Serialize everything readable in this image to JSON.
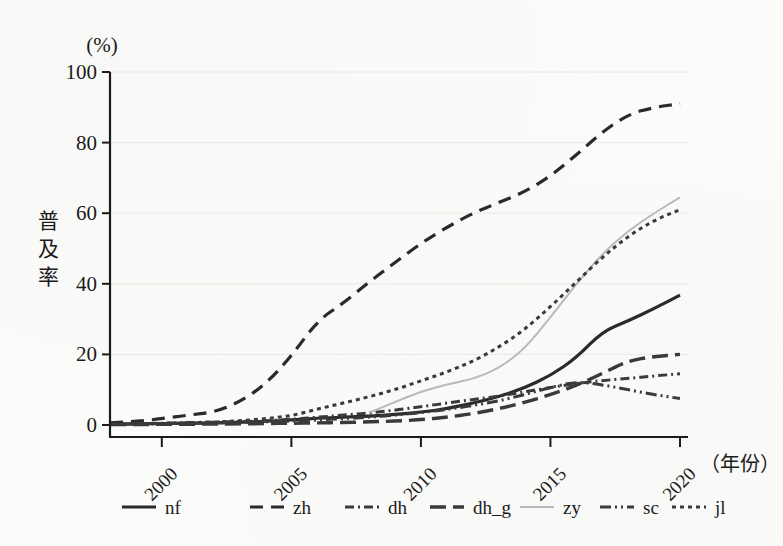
{
  "figure": {
    "background_color": "#fbfbf9",
    "ink_color": "#2a2a2a",
    "grid_color": "#e8e8e6"
  },
  "chart_data": {
    "type": "line",
    "title": "",
    "subtitle": "",
    "xlabel": "（年份）",
    "ylabel": "普及率",
    "yunit": "(%)",
    "xlim": [
      1998,
      2020
    ],
    "ylim": [
      0,
      100
    ],
    "grid": true,
    "legend_position": "bottom",
    "xticks": [
      2000,
      2005,
      2010,
      2015,
      2020
    ],
    "xtick_labels": [
      "2000",
      "2005",
      "2010",
      "2015",
      "2020"
    ],
    "yticks": [
      0,
      20,
      40,
      60,
      80,
      100
    ],
    "ytick_labels": [
      "0",
      "20",
      "40",
      "60",
      "80",
      "100"
    ],
    "x": [
      1998,
      1999,
      2000,
      2001,
      2002,
      2003,
      2004,
      2005,
      2006,
      2007,
      2008,
      2009,
      2010,
      2011,
      2012,
      2013,
      2014,
      2015,
      2016,
      2017,
      2018,
      2019,
      2020
    ],
    "series": [
      {
        "name": "nf",
        "label": "nf",
        "style": "solid",
        "color": "#2a2a2a",
        "width": 3.2,
        "dash": "",
        "values": [
          0.2,
          0.3,
          0.4,
          0.5,
          0.6,
          0.8,
          1.0,
          1.4,
          1.9,
          2.2,
          2.5,
          3.0,
          3.6,
          4.6,
          6.2,
          8.0,
          10.5,
          14.0,
          19.0,
          26.5,
          29.5,
          33.0,
          36.8
        ]
      },
      {
        "name": "zh",
        "label": "zh",
        "style": "dashed",
        "color": "#2a2a2a",
        "width": 3.2,
        "dash": "13,8",
        "values": [
          0.6,
          1.0,
          1.8,
          2.8,
          3.6,
          6.5,
          11.5,
          19.5,
          29.5,
          34.5,
          40.5,
          46.0,
          51.5,
          56.0,
          60.0,
          63.0,
          66.0,
          70.5,
          76.5,
          83.0,
          88.0,
          90.0,
          91.0
        ]
      },
      {
        "name": "dh",
        "label": "dh",
        "style": "dash-dot",
        "color": "#3a3a3a",
        "width": 3.0,
        "dash": "9,4,2,4",
        "values": [
          0.3,
          0.4,
          0.5,
          0.7,
          0.8,
          1.0,
          1.2,
          1.6,
          2.2,
          2.8,
          3.4,
          4.2,
          5.2,
          6.2,
          7.2,
          8.2,
          9.4,
          10.6,
          11.8,
          12.6,
          13.2,
          13.9,
          14.5
        ]
      },
      {
        "name": "dh_g",
        "label": "dh_g",
        "style": "long-dash",
        "color": "#3a3a3a",
        "width": 3.4,
        "dash": "16,7",
        "values": [
          0.1,
          0.1,
          0.2,
          0.2,
          0.3,
          0.3,
          0.4,
          0.5,
          0.6,
          0.7,
          0.9,
          1.1,
          1.5,
          2.2,
          3.2,
          4.6,
          6.4,
          8.6,
          11.2,
          14.6,
          18.2,
          19.4,
          20.0
        ]
      },
      {
        "name": "zy",
        "label": "zy",
        "style": "thin-light",
        "color": "#b9b9b9",
        "width": 2.0,
        "dash": "",
        "values": [
          null,
          null,
          null,
          null,
          null,
          null,
          null,
          null,
          null,
          null,
          3.5,
          6.5,
          9.5,
          11.5,
          13.0,
          16.0,
          21.5,
          30.5,
          40.0,
          48.5,
          55.0,
          60.0,
          64.5
        ]
      },
      {
        "name": "sc",
        "label": "sc",
        "style": "dash-dot-dot",
        "color": "#3a3a3a",
        "width": 3.0,
        "dash": "11,4,2,4,2,4",
        "values": [
          0.2,
          0.3,
          0.4,
          0.5,
          0.6,
          0.7,
          0.9,
          1.1,
          1.4,
          1.8,
          2.2,
          2.8,
          3.5,
          4.4,
          5.5,
          6.8,
          8.6,
          10.6,
          12.3,
          11.4,
          10.0,
          8.6,
          7.5
        ]
      },
      {
        "name": "jl",
        "label": "jl",
        "style": "dotted",
        "color": "#3a3a3a",
        "width": 3.0,
        "dash": "4,4",
        "values": [
          0.2,
          0.3,
          0.4,
          0.6,
          0.8,
          1.2,
          1.8,
          2.6,
          4.5,
          6.2,
          8.0,
          10.0,
          12.5,
          15.0,
          18.0,
          22.0,
          27.0,
          33.5,
          40.5,
          47.5,
          53.5,
          58.0,
          61.0
        ]
      }
    ]
  },
  "legend": {
    "entries": [
      {
        "label": "nf"
      },
      {
        "label": "zh"
      },
      {
        "label": "dh"
      },
      {
        "label": "dh_g"
      },
      {
        "label": "zy"
      },
      {
        "label": "sc"
      },
      {
        "label": "jl"
      }
    ]
  }
}
